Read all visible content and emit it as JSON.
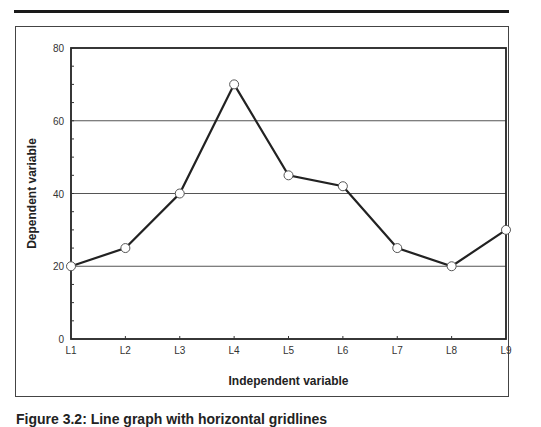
{
  "figure": {
    "caption": "Figure 3.2: Line graph with horizontal gridlines"
  },
  "chart_data": {
    "type": "line",
    "title": "",
    "xlabel": "Independent variable",
    "ylabel": "Dependent variable",
    "categories": [
      "L1",
      "L2",
      "L3",
      "L4",
      "L5",
      "L6",
      "L7",
      "L8",
      "L9"
    ],
    "series": [
      {
        "name": "Dependent variable",
        "values": [
          20,
          25,
          40,
          70,
          45,
          42,
          25,
          20,
          30
        ]
      }
    ],
    "ylim": [
      0,
      80
    ],
    "yticks": [
      0,
      20,
      40,
      60,
      80
    ],
    "grid": {
      "horizontal": [
        20,
        40,
        60
      ],
      "vertical": false
    },
    "legend": "none",
    "marker": "open-circle",
    "colors": {
      "line": "#222222",
      "grid": "#555555",
      "marker_fill": "#ffffff"
    }
  }
}
